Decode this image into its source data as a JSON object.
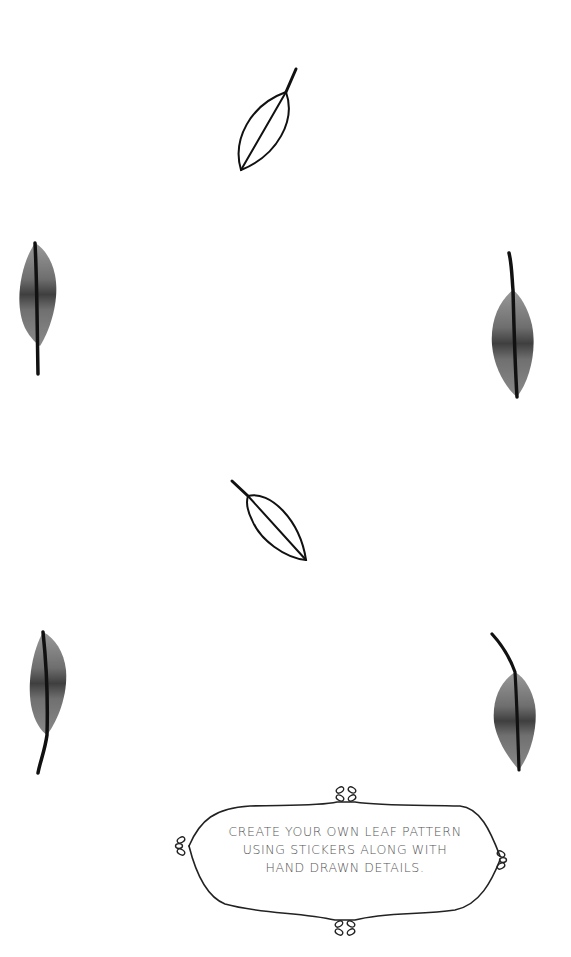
{
  "page": {
    "background": "#ffffff",
    "ink_color": "#111111"
  },
  "leaves": [
    {
      "name": "outline-leaf-top",
      "style": "outline"
    },
    {
      "name": "watercolor-leaf-left-upper",
      "style": "watercolor"
    },
    {
      "name": "watercolor-leaf-right-upper",
      "style": "watercolor"
    },
    {
      "name": "outline-leaf-middle",
      "style": "outline"
    },
    {
      "name": "watercolor-leaf-left-lower",
      "style": "watercolor"
    },
    {
      "name": "watercolor-leaf-right-lower",
      "style": "watercolor"
    }
  ],
  "caption": {
    "lines": [
      "CREATE YOUR OWN LEAF PATTERN",
      "USING STICKERS ALONG WITH",
      "HAND DRAWN DETAILS."
    ]
  }
}
